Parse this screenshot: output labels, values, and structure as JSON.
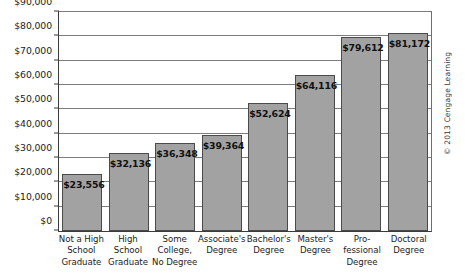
{
  "chart_data": {
    "type": "bar",
    "title": "",
    "subtitle": "",
    "xlabel": "",
    "ylabel": "",
    "ylim": [
      0,
      90000
    ],
    "grid": true,
    "legend": null,
    "categories": [
      "Not a High School Graduate",
      "High School Graduate",
      "Some College, No Degree",
      "Associate's Degree",
      "Bachelor's Degree",
      "Master's Degree",
      "Professional Degree",
      "Doctoral Degree"
    ],
    "category_lines": [
      [
        "Not a High",
        "School",
        "Graduate"
      ],
      [
        "High",
        "School",
        "Graduate"
      ],
      [
        "Some",
        "College,",
        "No Degree"
      ],
      [
        "Associate's",
        "Degree"
      ],
      [
        "Bachelor's",
        "Degree"
      ],
      [
        "Master's",
        "Degree"
      ],
      [
        "Pro-",
        "fessional",
        "Degree"
      ],
      [
        "Doctoral",
        "Degree"
      ]
    ],
    "values": [
      23556,
      32136,
      36348,
      39364,
      52624,
      64116,
      79612,
      81172
    ],
    "value_labels": [
      "$23,556",
      "$32,136",
      "$36,348",
      "$39,364",
      "$52,624",
      "$64,116",
      "$79,612",
      "$81,172"
    ],
    "ytick_values": [
      0,
      10000,
      20000,
      30000,
      40000,
      50000,
      60000,
      70000,
      80000,
      90000
    ],
    "ytick_labels": [
      "$0",
      "$10,000",
      "$20,000",
      "$30,000",
      "$40,000",
      "$50,000",
      "$60,000",
      "$70,000",
      "$80,000",
      "$90,000"
    ],
    "colors": {
      "bar_fill": "#a2a2a2",
      "bar_stroke": "#4a4a4a",
      "gridline": "#7d7d7d",
      "axis": "#3b3b3b",
      "text": "#1c1c1c",
      "background": "#ffffff"
    }
  },
  "credit": {
    "text": "© 2013 Cengage Learning"
  }
}
